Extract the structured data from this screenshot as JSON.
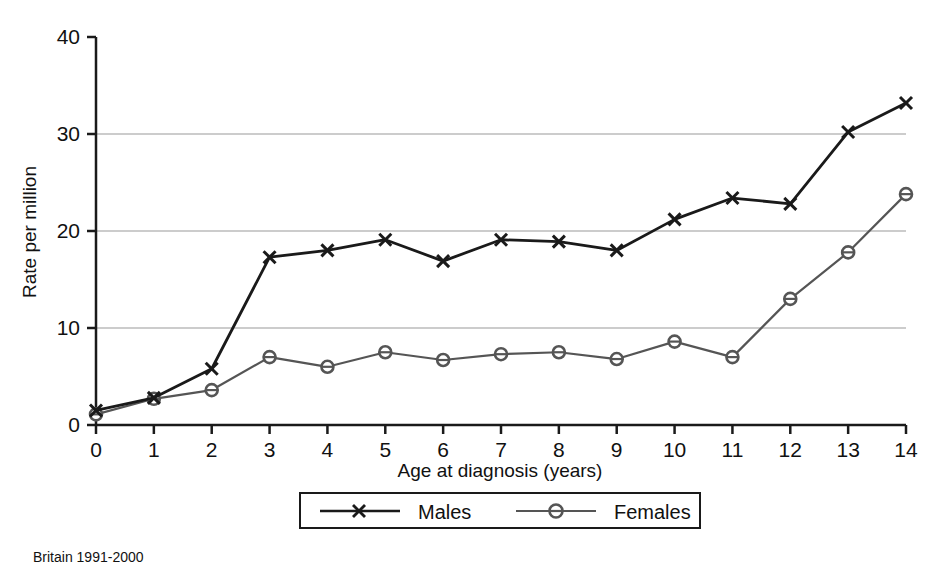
{
  "chart_data": {
    "type": "line",
    "title": "",
    "subtitle": "",
    "xlabel": "Age at diagnosis (years)",
    "ylabel": "Rate per million",
    "x": [
      0,
      1,
      2,
      3,
      4,
      5,
      6,
      7,
      8,
      9,
      10,
      11,
      12,
      13,
      14
    ],
    "categories": [
      "0",
      "1",
      "2",
      "3",
      "4",
      "5",
      "6",
      "7",
      "8",
      "9",
      "10",
      "11",
      "12",
      "13",
      "14"
    ],
    "series": [
      {
        "name": "Males",
        "marker": "x",
        "color": "#1a1a1a",
        "values": [
          1.5,
          2.8,
          5.8,
          17.3,
          18.0,
          19.1,
          16.9,
          19.1,
          18.9,
          18.0,
          21.2,
          23.4,
          22.8,
          30.2,
          33.2
        ]
      },
      {
        "name": "Females",
        "marker": "circle",
        "color": "#555555",
        "values": [
          1.1,
          2.7,
          3.6,
          7.0,
          6.0,
          7.5,
          6.7,
          7.3,
          7.5,
          6.8,
          8.6,
          7.0,
          13.0,
          17.8,
          23.8
        ]
      }
    ],
    "xlim": [
      0,
      14
    ],
    "ylim": [
      0,
      40
    ],
    "xticks": [
      "0",
      "1",
      "2",
      "3",
      "4",
      "5",
      "6",
      "7",
      "8",
      "9",
      "10",
      "11",
      "12",
      "13",
      "14"
    ],
    "yticks": [
      "0",
      "10",
      "20",
      "30",
      "40"
    ],
    "grid": "horizontal",
    "gridline_values": [
      10,
      20,
      30
    ],
    "gridline_color": "#cccccc",
    "legend_position": "bottom",
    "legend_entries": [
      "Males",
      "Females"
    ],
    "annotations": [
      "Britain 1991-2000"
    ]
  },
  "axes": {
    "y_title": "Rate per million",
    "x_title": "Age at diagnosis (years)",
    "y_tick_labels": [
      "40",
      "30",
      "20",
      "10",
      "0"
    ],
    "x_tick_labels": [
      "0",
      "1",
      "2",
      "3",
      "4",
      "5",
      "6",
      "7",
      "8",
      "9",
      "10",
      "11",
      "12",
      "13",
      "14"
    ]
  },
  "legend": {
    "males_label": "Males",
    "females_label": "Females"
  },
  "caption": {
    "text": "Britain 1991-2000"
  },
  "colors": {
    "males_line": "#1a1a1a",
    "females_line": "#555555",
    "axis": "#1a1a1a",
    "gridline": "#cccccc",
    "background": "#ffffff"
  }
}
